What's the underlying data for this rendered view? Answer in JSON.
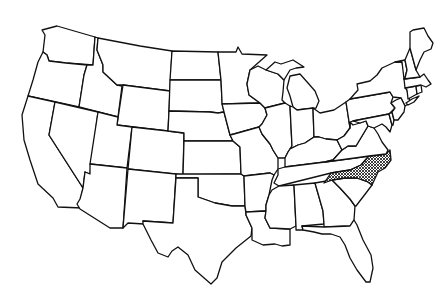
{
  "map": {
    "title": "United States outline map",
    "highlighted_state": "North Carolina",
    "highlight_pattern": "crosshatch",
    "stroke_color": "#111111",
    "fill_color": "#ffffff",
    "highlight_color": "#111111"
  },
  "states": [
    {
      "id": "WA",
      "name": "Washington"
    },
    {
      "id": "OR",
      "name": "Oregon"
    },
    {
      "id": "CA",
      "name": "California"
    },
    {
      "id": "ID",
      "name": "Idaho"
    },
    {
      "id": "NV",
      "name": "Nevada"
    },
    {
      "id": "MT",
      "name": "Montana"
    },
    {
      "id": "WY",
      "name": "Wyoming"
    },
    {
      "id": "UT",
      "name": "Utah"
    },
    {
      "id": "AZ",
      "name": "Arizona"
    },
    {
      "id": "CO",
      "name": "Colorado"
    },
    {
      "id": "NM",
      "name": "New Mexico"
    },
    {
      "id": "ND",
      "name": "North Dakota"
    },
    {
      "id": "SD",
      "name": "South Dakota"
    },
    {
      "id": "NE",
      "name": "Nebraska"
    },
    {
      "id": "KS",
      "name": "Kansas"
    },
    {
      "id": "OK",
      "name": "Oklahoma"
    },
    {
      "id": "TX",
      "name": "Texas"
    },
    {
      "id": "MN",
      "name": "Minnesota"
    },
    {
      "id": "IA",
      "name": "Iowa"
    },
    {
      "id": "MO",
      "name": "Missouri"
    },
    {
      "id": "AR",
      "name": "Arkansas"
    },
    {
      "id": "LA",
      "name": "Louisiana"
    },
    {
      "id": "WI",
      "name": "Wisconsin"
    },
    {
      "id": "IL",
      "name": "Illinois"
    },
    {
      "id": "MI",
      "name": "Michigan"
    },
    {
      "id": "IN",
      "name": "Indiana"
    },
    {
      "id": "OH",
      "name": "Ohio"
    },
    {
      "id": "KY",
      "name": "Kentucky"
    },
    {
      "id": "TN",
      "name": "Tennessee"
    },
    {
      "id": "MS",
      "name": "Mississippi"
    },
    {
      "id": "AL",
      "name": "Alabama"
    },
    {
      "id": "GA",
      "name": "Georgia"
    },
    {
      "id": "FL",
      "name": "Florida"
    },
    {
      "id": "SC",
      "name": "South Carolina"
    },
    {
      "id": "NC",
      "name": "North Carolina",
      "highlighted": true
    },
    {
      "id": "VA",
      "name": "Virginia"
    },
    {
      "id": "WV",
      "name": "West Virginia"
    },
    {
      "id": "PA",
      "name": "Pennsylvania"
    },
    {
      "id": "NY",
      "name": "New York"
    },
    {
      "id": "MD",
      "name": "Maryland"
    },
    {
      "id": "DE",
      "name": "Delaware"
    },
    {
      "id": "NJ",
      "name": "New Jersey"
    },
    {
      "id": "CT",
      "name": "Connecticut"
    },
    {
      "id": "RI",
      "name": "Rhode Island"
    },
    {
      "id": "MA",
      "name": "Massachusetts"
    },
    {
      "id": "VT",
      "name": "Vermont"
    },
    {
      "id": "NH",
      "name": "New Hampshire"
    },
    {
      "id": "ME",
      "name": "Maine"
    }
  ]
}
